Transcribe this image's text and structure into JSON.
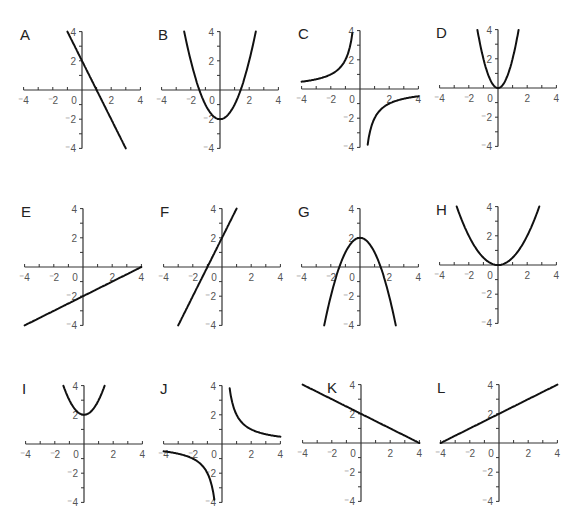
{
  "axis": {
    "range": [
      -4,
      4
    ],
    "x_tick_labels": [
      "-4",
      "-2",
      "0",
      "2",
      "4"
    ],
    "y_tick_labels": [
      "4",
      "2",
      "-2",
      "-4"
    ],
    "origin_label": "0"
  },
  "chart_data": [
    {
      "type": "line",
      "title": "A",
      "expression": "y = -2x + 2",
      "x": [
        -1,
        3
      ],
      "y": [
        4,
        -4
      ],
      "xlim": [
        -4,
        4
      ],
      "ylim": [
        -4,
        4
      ]
    },
    {
      "type": "line",
      "title": "B",
      "expression": "y = x^2 - 2",
      "x": [
        -2.45,
        -1.41,
        0,
        1.41,
        2.45
      ],
      "y": [
        4,
        0,
        -2,
        0,
        4
      ],
      "xlim": [
        -4,
        4
      ],
      "ylim": [
        -4,
        4
      ]
    },
    {
      "type": "line",
      "title": "C",
      "expression": "y = -2/x",
      "x": [
        -4,
        -2,
        -1,
        -0.5,
        0.5,
        1,
        2,
        4
      ],
      "y": [
        0.5,
        1,
        2,
        4,
        -4,
        -2,
        -1,
        -0.5
      ],
      "xlim": [
        -4,
        4
      ],
      "ylim": [
        -4,
        4
      ]
    },
    {
      "type": "line",
      "title": "D",
      "expression": "y = 2x^2",
      "x": [
        -1.41,
        -1,
        0,
        1,
        1.41
      ],
      "y": [
        4,
        2,
        0,
        2,
        4
      ],
      "xlim": [
        -4,
        4
      ],
      "ylim": [
        -4,
        4
      ]
    },
    {
      "type": "line",
      "title": "E",
      "expression": "y = 0.5x - 2",
      "x": [
        -4,
        0,
        4
      ],
      "y": [
        -4,
        -2,
        0
      ],
      "xlim": [
        -4,
        4
      ],
      "ylim": [
        -4,
        4
      ]
    },
    {
      "type": "line",
      "title": "F",
      "expression": "y = 2x + 2",
      "x": [
        -3,
        -1,
        0,
        1
      ],
      "y": [
        -4,
        0,
        2,
        4
      ],
      "xlim": [
        -4,
        4
      ],
      "ylim": [
        -4,
        4
      ]
    },
    {
      "type": "line",
      "title": "G",
      "expression": "y = 2 - x^2",
      "x": [
        -2.45,
        -1.41,
        0,
        1.41,
        2.45
      ],
      "y": [
        -4,
        0,
        2,
        0,
        -4
      ],
      "xlim": [
        -4,
        4
      ],
      "ylim": [
        -4,
        4
      ]
    },
    {
      "type": "line",
      "title": "H",
      "expression": "y = 0.5x^2",
      "x": [
        -2.83,
        -2,
        0,
        2,
        2.83
      ],
      "y": [
        4,
        2,
        0,
        2,
        4
      ],
      "xlim": [
        -4,
        4
      ],
      "ylim": [
        -4,
        4
      ]
    },
    {
      "type": "line",
      "title": "I",
      "expression": "y = x^2 + 2",
      "x": [
        -1.41,
        0,
        1.41
      ],
      "y": [
        4,
        2,
        4
      ],
      "xlim": [
        -4,
        4
      ],
      "ylim": [
        -4,
        4
      ]
    },
    {
      "type": "line",
      "title": "J",
      "expression": "y = 2/x",
      "x": [
        -4,
        -2,
        -1,
        -0.5,
        0.5,
        1,
        2,
        4
      ],
      "y": [
        -0.5,
        -1,
        -2,
        -4,
        4,
        2,
        1,
        0.5
      ],
      "xlim": [
        -4,
        4
      ],
      "ylim": [
        -4,
        4
      ]
    },
    {
      "type": "line",
      "title": "K",
      "expression": "y = -0.5x + 2",
      "x": [
        -4,
        0,
        4
      ],
      "y": [
        4,
        2,
        0
      ],
      "xlim": [
        -4,
        4
      ],
      "ylim": [
        -4,
        4
      ]
    },
    {
      "type": "line",
      "title": "L",
      "expression": "y = 0.5x + 2",
      "x": [
        -4,
        0,
        4
      ],
      "y": [
        0,
        2,
        4
      ],
      "xlim": [
        -4,
        4
      ],
      "ylim": [
        -4,
        4
      ]
    }
  ],
  "panels": [
    {
      "label": "A",
      "ox": 82,
      "oy": 90,
      "fn": "lin",
      "a": -2,
      "b": 2,
      "xmin": -1,
      "xmax": 3
    },
    {
      "label": "B",
      "ox": 220,
      "oy": 90,
      "fn": "quad",
      "a": 1,
      "b": -2,
      "xmin": -2.45,
      "xmax": 2.45
    },
    {
      "label": "C",
      "ox": 360,
      "oy": 89,
      "fn": "inv",
      "a": -2,
      "b": 0,
      "xmin": -4,
      "xmax": 4
    },
    {
      "label": "D",
      "ox": 498,
      "oy": 88,
      "fn": "quad",
      "a": 2,
      "b": 0,
      "xmin": -1.41,
      "xmax": 1.41
    },
    {
      "label": "E",
      "ox": 83,
      "oy": 267,
      "fn": "lin",
      "a": 0.5,
      "b": -2,
      "xmin": -4,
      "xmax": 4
    },
    {
      "label": "F",
      "ox": 222,
      "oy": 267,
      "fn": "lin",
      "a": 2,
      "b": 2,
      "xmin": -3,
      "xmax": 1
    },
    {
      "label": "G",
      "ox": 360,
      "oy": 267,
      "fn": "quad",
      "a": -1,
      "b": 2,
      "xmin": -2.45,
      "xmax": 2.45
    },
    {
      "label": "H",
      "ox": 498,
      "oy": 265,
      "fn": "quad",
      "a": 0.5,
      "b": 0,
      "xmin": -2.83,
      "xmax": 2.83
    },
    {
      "label": "I",
      "ox": 84,
      "oy": 444,
      "fn": "quad",
      "a": 1,
      "b": 2,
      "xmin": -1.41,
      "xmax": 1.41
    },
    {
      "label": "J",
      "ox": 222,
      "oy": 444,
      "fn": "inv",
      "a": 2,
      "b": 0,
      "xmin": -4,
      "xmax": 4
    },
    {
      "label": "K",
      "ox": 361,
      "oy": 443,
      "fn": "lin",
      "a": -0.5,
      "b": 2,
      "xmin": -4,
      "xmax": 4
    },
    {
      "label": "L",
      "ox": 499,
      "oy": 443,
      "fn": "lin",
      "a": 0.5,
      "b": 2,
      "xmin": -4,
      "xmax": 4
    }
  ]
}
